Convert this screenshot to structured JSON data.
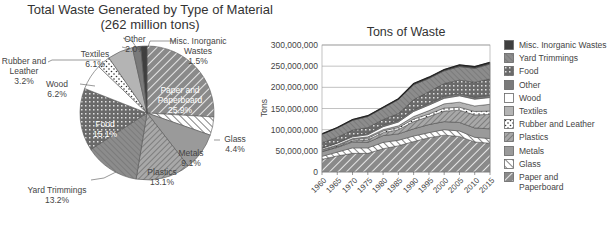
{
  "chart_data": [
    {
      "type": "pie",
      "title": "Total Waste Generated by Type of Material",
      "subtitle": "(262 million tons)",
      "categories": [
        "Paper and Paperboard",
        "Glass",
        "Metals",
        "Plastics",
        "Yard Trimmings",
        "Food",
        "Wood",
        "Rubber and Leather",
        "Textiles",
        "Other",
        "Misc. Inorganic Wastes"
      ],
      "values": [
        25.9,
        4.4,
        9.1,
        13.1,
        13.2,
        15.1,
        6.2,
        3.2,
        6.1,
        2.0,
        1.5
      ],
      "unit": "%",
      "labels": [
        {
          "name": "Paper and Paperboard",
          "line1": "Paper and",
          "line2": "Paperboard",
          "pct": "25.9%"
        },
        {
          "name": "Glass",
          "line1": "Glass",
          "pct": "4.4%"
        },
        {
          "name": "Metals",
          "line1": "Metals",
          "pct": "9.1%"
        },
        {
          "name": "Plastics",
          "line1": "Plastics",
          "pct": "13.1%"
        },
        {
          "name": "Yard Trimmings",
          "line1": "Yard Trimmings",
          "pct": "13.2%"
        },
        {
          "name": "Food",
          "line1": "Food",
          "pct": "15.1%"
        },
        {
          "name": "Wood",
          "line1": "Wood",
          "pct": "6.2%"
        },
        {
          "name": "Rubber and Leather",
          "line1": "Rubber and",
          "line2": "Leather",
          "pct": "3.2%"
        },
        {
          "name": "Textiles",
          "line1": "Textiles",
          "pct": "6.1%"
        },
        {
          "name": "Other",
          "line1": "Other",
          "pct": "2.0%"
        },
        {
          "name": "Misc. Inorganic Wastes",
          "line1": "Misc. Inorganic",
          "line2": "Wastes",
          "pct": "1.5%"
        }
      ]
    },
    {
      "type": "area",
      "stacked": true,
      "title": "Tons of Waste",
      "xlabel": "",
      "ylabel": "Tons",
      "ylim": [
        0,
        300000000
      ],
      "yticks": [
        "0",
        "50,000,000",
        "100,000,000",
        "150,000,000",
        "200,000,000",
        "250,000,000",
        "300,000,000"
      ],
      "x": [
        1960,
        1965,
        1970,
        1975,
        1980,
        1985,
        1990,
        1995,
        2000,
        2005,
        2010,
        2015
      ],
      "xticks": [
        "1960",
        "1965",
        "1970",
        "1975",
        "1980",
        "1985",
        "1990",
        "1995",
        "2000",
        "2005",
        "2010",
        "2015"
      ],
      "grid": true,
      "legend_position": "right",
      "series": [
        {
          "name": "Paper and Paperboard",
          "values": [
            30000000,
            38000000,
            44000000,
            44000000,
            55000000,
            62000000,
            72000000,
            81000000,
            87000000,
            84000000,
            71000000,
            68000000
          ]
        },
        {
          "name": "Glass",
          "values": [
            7000000,
            9000000,
            13000000,
            13000000,
            15000000,
            13000000,
            13000000,
            12000000,
            13000000,
            13000000,
            11000000,
            11000000
          ]
        },
        {
          "name": "Metals",
          "values": [
            11000000,
            11000000,
            14000000,
            13000000,
            16000000,
            15000000,
            17000000,
            19000000,
            19000000,
            20000000,
            22000000,
            23000000
          ]
        },
        {
          "name": "Plastics",
          "values": [
            1000000,
            2000000,
            3000000,
            6000000,
            7000000,
            10000000,
            17000000,
            19000000,
            25000000,
            29000000,
            31000000,
            34000000
          ]
        },
        {
          "name": "Rubber and Leather",
          "values": [
            2000000,
            2000000,
            3000000,
            4000000,
            4000000,
            5000000,
            6000000,
            6000000,
            7000000,
            7000000,
            8000000,
            8000000
          ]
        },
        {
          "name": "Textiles",
          "values": [
            2000000,
            2000000,
            2000000,
            3000000,
            3000000,
            4000000,
            6000000,
            8000000,
            10000000,
            12000000,
            13000000,
            16000000
          ]
        },
        {
          "name": "Wood",
          "values": [
            3000000,
            4000000,
            4000000,
            5000000,
            7000000,
            9000000,
            12000000,
            13000000,
            13000000,
            15000000,
            16000000,
            16000000
          ]
        },
        {
          "name": "Other",
          "values": [
            1000000,
            1000000,
            3000000,
            3000000,
            4000000,
            4000000,
            4000000,
            4000000,
            5000000,
            5000000,
            5000000,
            5000000
          ]
        },
        {
          "name": "Food",
          "values": [
            12000000,
            13000000,
            13000000,
            14000000,
            13000000,
            16000000,
            24000000,
            28000000,
            30000000,
            32000000,
            35000000,
            39000000
          ]
        },
        {
          "name": "Yard Trimmings",
          "values": [
            20000000,
            22000000,
            23000000,
            26000000,
            27000000,
            33000000,
            35000000,
            31000000,
            30000000,
            32000000,
            33000000,
            35000000
          ]
        },
        {
          "name": "Misc. Inorganic Wastes",
          "values": [
            1000000,
            1000000,
            2000000,
            2000000,
            2000000,
            2000000,
            3000000,
            3000000,
            3000000,
            4000000,
            4000000,
            4000000
          ]
        }
      ]
    }
  ],
  "legend": [
    {
      "label": "Misc. Inorganic Wastes",
      "swatch": "misc"
    },
    {
      "label": "Yard Trimmings",
      "swatch": "yard"
    },
    {
      "label": "Food",
      "swatch": "food"
    },
    {
      "label": "Other",
      "swatch": "other"
    },
    {
      "label": "Wood",
      "swatch": "wood"
    },
    {
      "label": "Textiles",
      "swatch": "textiles"
    },
    {
      "label": "Rubber and Leather",
      "swatch": "rubber"
    },
    {
      "label": "Plastics",
      "swatch": "plastics"
    },
    {
      "label": "Metals",
      "swatch": "metals"
    },
    {
      "label": "Glass",
      "swatch": "glass"
    },
    {
      "label": "Paper and",
      "label2": "Paperboard",
      "swatch": "paper"
    }
  ],
  "colors": {
    "paper": "#8a8a8a",
    "glass": "#ffffff",
    "metals": "#9a9a9a",
    "plastics": "#a8a8a8",
    "yard": "#8c8c8c",
    "food": "#6f6f6f",
    "wood": "#ffffff",
    "rubber": "#ffffff",
    "textiles": "#b4b4b4",
    "other": "#7a7a7a",
    "misc": "#3f3f3f"
  }
}
